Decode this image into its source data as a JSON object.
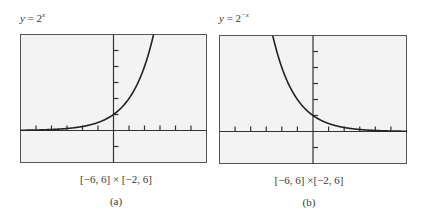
{
  "figure": {
    "panels": [
      {
        "id": "a",
        "title_prefix": "y",
        "title_eq": " = 2",
        "title_exp": "x",
        "window": "[−6, 6] × [−2, 6]",
        "label": "(a)"
      },
      {
        "id": "b",
        "title_prefix": "y",
        "title_eq": " = 2",
        "title_exp": "−x",
        "window": "[−6, 6] ×[−2, 6]",
        "label": "(b)"
      }
    ]
  },
  "chart_data": [
    {
      "type": "line",
      "title": "y = 2^x",
      "function": "2^x",
      "xlim": [
        -6,
        6
      ],
      "ylim": [
        -2,
        6
      ],
      "x_ticks": [
        -5,
        -4,
        -3,
        -2,
        -1,
        1,
        2,
        3,
        4,
        5
      ],
      "y_ticks": [
        -1,
        1,
        2,
        3,
        4,
        5
      ],
      "grid": false,
      "x": [
        -6,
        -5,
        -4,
        -3,
        -2,
        -1,
        0,
        1,
        2,
        2.585
      ],
      "y": [
        0.016,
        0.031,
        0.063,
        0.125,
        0.25,
        0.5,
        1,
        2,
        4,
        6
      ],
      "caption": "[−6, 6] × [−2, 6]",
      "label": "(a)"
    },
    {
      "type": "line",
      "title": "y = 2^−x",
      "function": "2^(-x)",
      "xlim": [
        -6,
        6
      ],
      "ylim": [
        -2,
        6
      ],
      "x_ticks": [
        -5,
        -4,
        -3,
        -2,
        -1,
        1,
        2,
        3,
        4,
        5
      ],
      "y_ticks": [
        -1,
        1,
        2,
        3,
        4,
        5
      ],
      "grid": false,
      "x": [
        -2.585,
        -2,
        -1,
        0,
        1,
        2,
        3,
        4,
        5,
        6
      ],
      "y": [
        6,
        4,
        2,
        1,
        0.5,
        0.25,
        0.125,
        0.063,
        0.031,
        0.016
      ],
      "caption": "[−6, 6] ×[−2, 6]",
      "label": "(b)"
    }
  ]
}
